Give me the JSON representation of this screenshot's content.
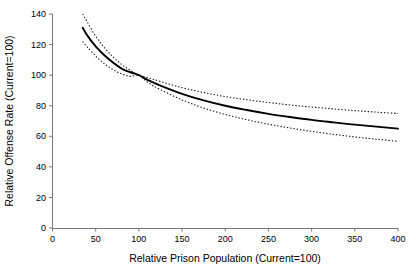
{
  "chart_data": {
    "type": "line",
    "title": "",
    "xlabel": "Relative Prison Population (Current=100)",
    "ylabel": "Relative Offense Rate (Current=100)",
    "xlim": [
      0,
      400
    ],
    "ylim": [
      0,
      140
    ],
    "xticks": [
      0,
      50,
      100,
      150,
      200,
      250,
      300,
      350,
      400
    ],
    "yticks": [
      0,
      20,
      40,
      60,
      80,
      100,
      120,
      140
    ],
    "grid": false,
    "legend": "none",
    "x": [
      35,
      40,
      50,
      60,
      70,
      80,
      90,
      100,
      110,
      125,
      150,
      175,
      200,
      225,
      250,
      275,
      300,
      325,
      350,
      375,
      400
    ],
    "series": [
      {
        "name": "Estimated offense rate",
        "style": "solid",
        "color": "#000000",
        "values": [
          131.0,
          126.2,
          118.8,
          113.0,
          108.3,
          104.3,
          101.9,
          100.0,
          96.9,
          93.2,
          87.8,
          83.5,
          80.0,
          77.2,
          74.7,
          72.6,
          70.7,
          69.1,
          67.6,
          66.3,
          65.0
        ]
      },
      {
        "name": "Upper confidence bound",
        "style": "dotted",
        "color": "#000000",
        "values": [
          140.0,
          135.0,
          125.5,
          118.0,
          112.0,
          107.0,
          103.2,
          100.0,
          98.4,
          95.8,
          91.8,
          88.6,
          86.0,
          83.9,
          82.1,
          80.5,
          79.1,
          77.9,
          76.8,
          75.8,
          74.9
        ]
      },
      {
        "name": "Lower confidence bound",
        "style": "dotted",
        "color": "#000000",
        "values": [
          122.0,
          118.5,
          112.5,
          107.5,
          103.6,
          100.8,
          99.2,
          100.0,
          95.3,
          90.5,
          83.8,
          78.5,
          74.3,
          70.8,
          67.9,
          65.4,
          63.2,
          61.3,
          59.6,
          58.1,
          56.7
        ]
      }
    ]
  },
  "axes": {
    "x_tick_labels": [
      "0",
      "50",
      "100",
      "150",
      "200",
      "250",
      "300",
      "350",
      "400"
    ],
    "y_tick_labels": [
      "0",
      "20",
      "40",
      "60",
      "80",
      "100",
      "120",
      "140"
    ],
    "x_axis_title": "Relative Prison Population (Current=100)",
    "y_axis_title": "Relative Offense Rate (Current=100)"
  }
}
